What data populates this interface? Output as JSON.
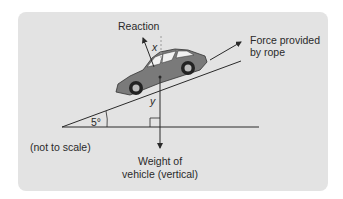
{
  "diagram": {
    "labels": {
      "reaction": "Reaction",
      "force_line1": "Force provided",
      "force_line2": "by rope",
      "angle": "5°",
      "not_to_scale": "(not to scale)",
      "weight_line1": "Weight of",
      "weight_line2": "vehicle (vertical)",
      "x": "x",
      "y": "y"
    },
    "colors": {
      "panel": "#e3e3e3",
      "line": "#2a2a2a",
      "car_body": "#7a7a7a",
      "car_window": "#f2f2f2",
      "dashed": "#9a9a9a"
    }
  }
}
